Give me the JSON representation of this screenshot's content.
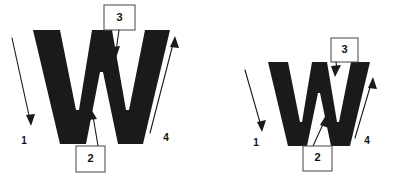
{
  "figure": {
    "background_color": "#ffffff",
    "ink_color": "#1a1a1a",
    "box_stroke_color": "#555555"
  },
  "panels": [
    {
      "id": "left-panel",
      "glyph": "W",
      "glyph_size": "large",
      "annotations": [
        {
          "id": "left-1",
          "label": "1",
          "boxed": false,
          "direction": "down-right"
        },
        {
          "id": "left-2",
          "label": "2",
          "boxed": true,
          "direction": "up"
        },
        {
          "id": "left-3",
          "label": "3",
          "boxed": true,
          "direction": "down"
        },
        {
          "id": "left-4",
          "label": "4",
          "boxed": false,
          "direction": "up-right"
        }
      ]
    },
    {
      "id": "right-panel",
      "glyph": "W",
      "glyph_size": "small",
      "annotations": [
        {
          "id": "right-1",
          "label": "1",
          "boxed": false,
          "direction": "down-right"
        },
        {
          "id": "right-2",
          "label": "2",
          "boxed": true,
          "direction": "up"
        },
        {
          "id": "right-3",
          "label": "3",
          "boxed": true,
          "direction": "down"
        },
        {
          "id": "right-4",
          "label": "4",
          "boxed": false,
          "direction": "up-right"
        }
      ]
    }
  ]
}
